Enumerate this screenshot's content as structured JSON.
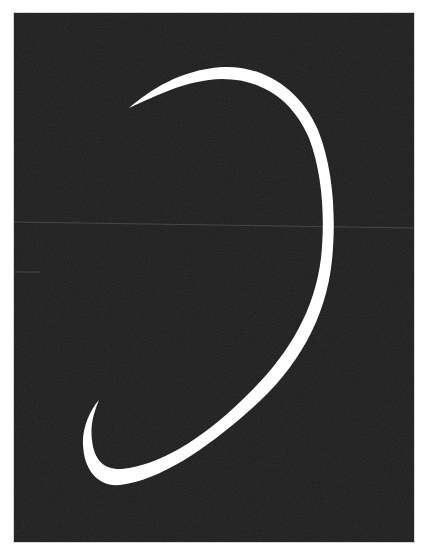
{
  "image": {
    "description": "White curved stroke on black background, shaped like a large reversed C / crescent with tapered ends",
    "colors": {
      "page_background": "#ffffff",
      "panel_background": "#1b1b1b",
      "stroke": "#ffffff",
      "scan_line": "#5a5a5a",
      "frame_border": "#d6d6d6"
    },
    "panel": {
      "x": 14,
      "y": 13,
      "width": 400,
      "height": 529
    },
    "curve": {
      "top_tip": [
        129,
        108
      ],
      "top_apex": [
        220,
        72
      ],
      "right_extreme": [
        328,
        228
      ],
      "bottom_extreme": [
        118,
        478
      ],
      "left_extreme": [
        87,
        438
      ],
      "bottom_tip": [
        99,
        400
      ]
    },
    "artifacts": {
      "horizontal_line": {
        "from": [
          14,
          222
        ],
        "to": [
          414,
          228
        ]
      },
      "short_dash": {
        "from": [
          15,
          272
        ],
        "to": [
          40,
          272
        ]
      }
    }
  }
}
